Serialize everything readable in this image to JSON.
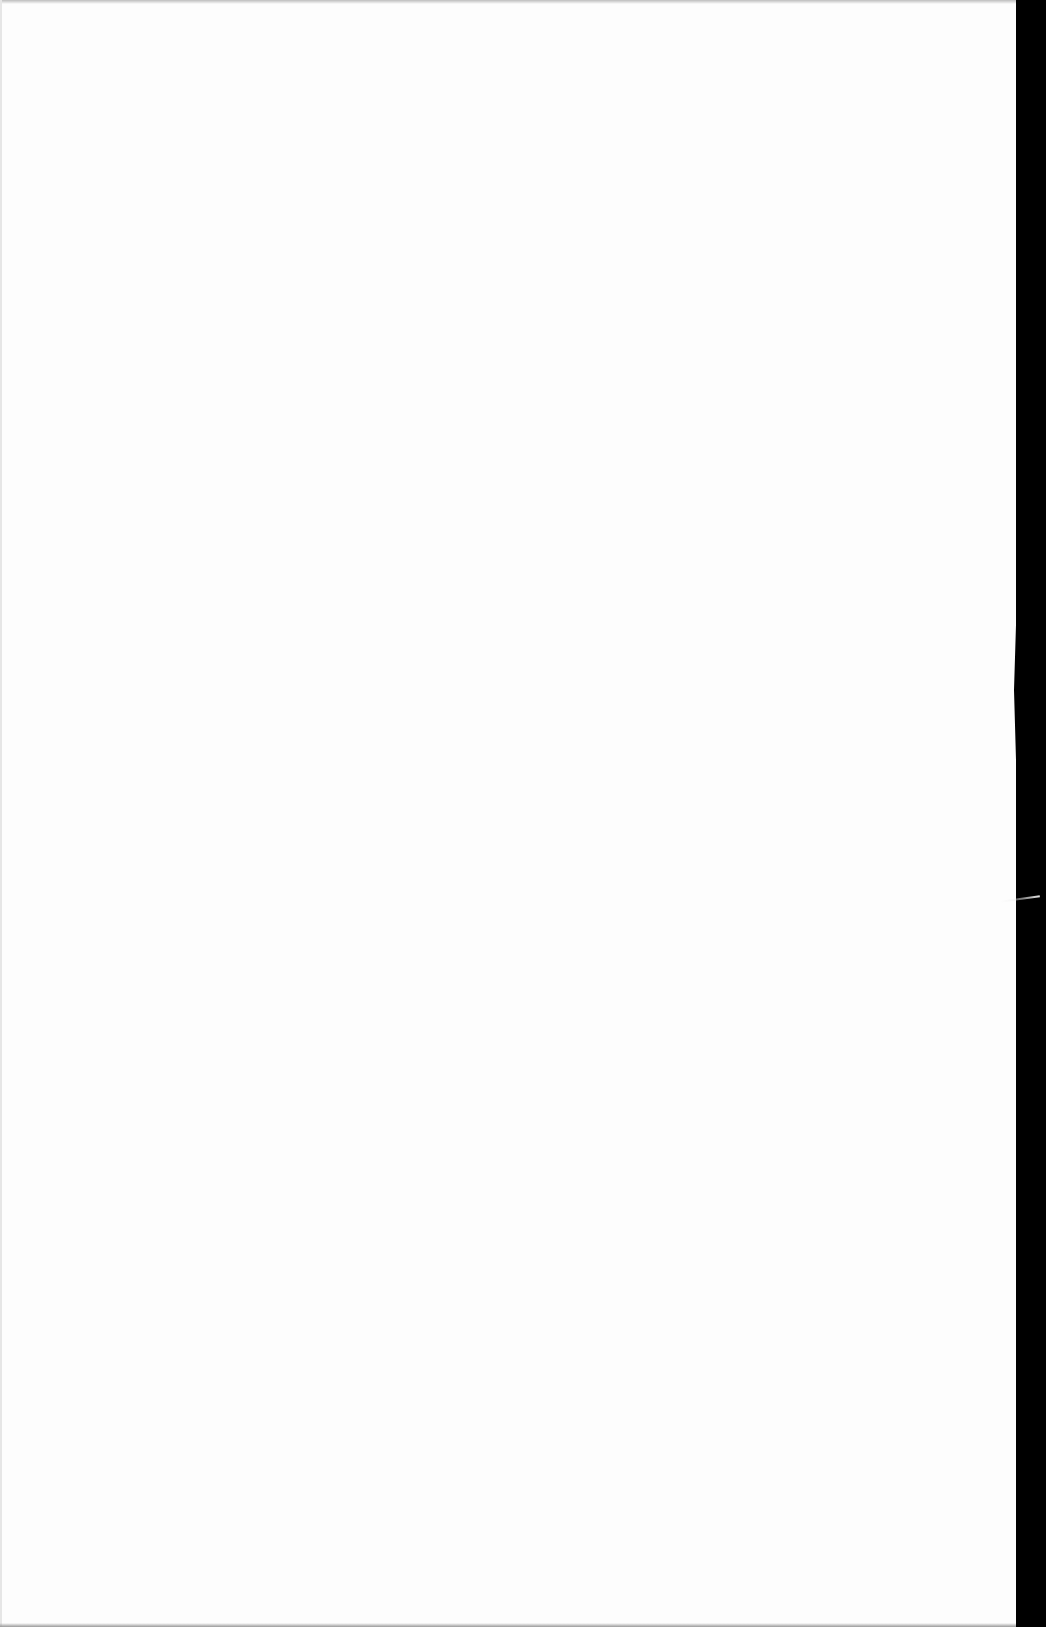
{
  "document": {
    "type": "scanned-blank-page",
    "content_text": "",
    "colors": {
      "paper": "#fdfdfd",
      "scan_background": "#000000"
    }
  }
}
